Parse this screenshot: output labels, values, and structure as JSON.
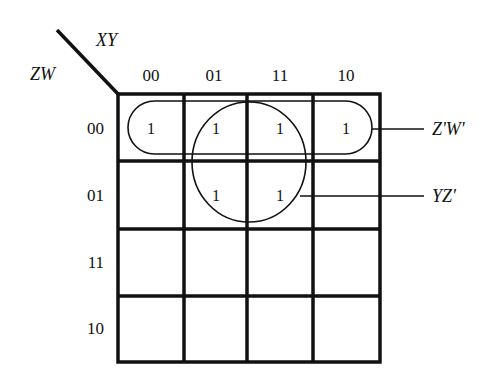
{
  "kmap": {
    "row_variables": "ZW",
    "column_variables": "XY",
    "column_headers": [
      "00",
      "01",
      "11",
      "10"
    ],
    "row_headers": [
      "00",
      "01",
      "11",
      "10"
    ],
    "cells": [
      [
        "1",
        "1",
        "1",
        "1"
      ],
      [
        "",
        "1",
        "1",
        ""
      ],
      [
        "",
        "",
        "",
        ""
      ],
      [
        "",
        "",
        "",
        ""
      ]
    ],
    "groups": [
      {
        "name": "row-group",
        "shape": "rounded-rectangle",
        "covers": "row 00, all columns",
        "label": "Z'W'"
      },
      {
        "name": "quad-group",
        "shape": "circle",
        "covers": "rows 00-01, columns 01-11",
        "label": "YZ'"
      }
    ]
  },
  "colors": {
    "ink": "#111111",
    "background": "#ffffff"
  }
}
